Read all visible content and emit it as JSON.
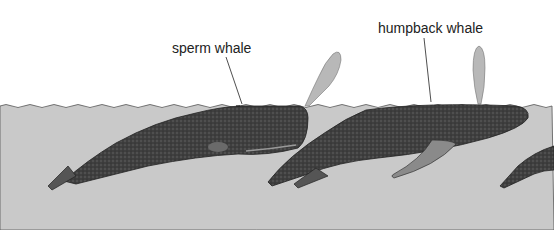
{
  "illustration": {
    "labels": {
      "sperm_whale": "sperm whale",
      "humpback_whale": "humpback whale"
    },
    "colors": {
      "sky": "#ffffff",
      "water": "#c9c9c9",
      "whale_body": "#3a3a3a",
      "spout": "#b8b8b8",
      "label_text": "#222222"
    }
  }
}
